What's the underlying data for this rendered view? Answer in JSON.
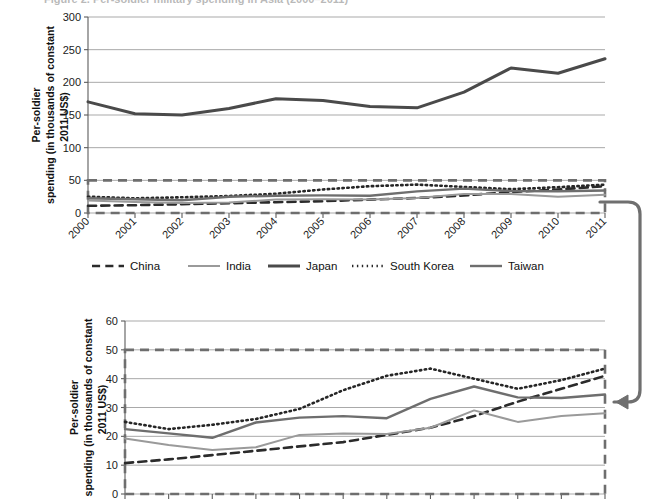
{
  "figure": {
    "title_fragment": "Figure 2. Per-soldier military spending in Asia (2000–2011)",
    "callout_name": "zoom-callout-arrow"
  },
  "axis": {
    "ylabel_line1": "Per-soldier",
    "ylabel_line2": "spending (in thousands of constant",
    "ylabel_line3": "2011 US$)",
    "ylabel_full": "Per-soldier spending (in thousands of constant 2011 US$)"
  },
  "legend": {
    "position": "below-top-chart",
    "items": [
      {
        "label": "China",
        "style": "dashed",
        "color": "#2b2b2b",
        "width": 2.6
      },
      {
        "label": "India",
        "style": "solid",
        "color": "#9a9a9a",
        "width": 2.0
      },
      {
        "label": "Japan",
        "style": "solid",
        "color": "#4a4a4a",
        "width": 3.0
      },
      {
        "label": "South Korea",
        "style": "dotted",
        "color": "#262626",
        "width": 2.6
      },
      {
        "label": "Taiwan",
        "style": "solid",
        "color": "#6e6e6e",
        "width": 2.4
      }
    ]
  },
  "chart_data": [
    {
      "id": "top-chart",
      "type": "line",
      "title": "",
      "xlabel": "",
      "ylabel": "Per-soldier spending (in thousands of constant 2011 US$)",
      "x": [
        "2000",
        "2001",
        "2002",
        "2003",
        "2004",
        "2005",
        "2006",
        "2007",
        "2008",
        "2009",
        "2010",
        "2011"
      ],
      "ylim": [
        0,
        300
      ],
      "yticks": [
        0,
        50,
        100,
        150,
        200,
        250,
        300
      ],
      "grid": true,
      "legend": "below",
      "highlight_box": {
        "y_from": 0,
        "y_to": 50,
        "style": "dashed",
        "color": "#6e6e6e"
      },
      "series": [
        {
          "name": "China",
          "values": [
            11,
            12,
            13.5,
            15,
            16.5,
            18,
            20.5,
            23,
            27,
            32,
            36,
            41
          ]
        },
        {
          "name": "India",
          "values": [
            19,
            17,
            15.3,
            16.2,
            20.5,
            21,
            20.8,
            23,
            29,
            29,
            25,
            28
          ]
        },
        {
          "name": "Japan",
          "values": [
            170,
            152,
            150,
            160,
            175,
            172,
            163,
            161,
            185,
            222,
            214,
            236
          ]
        },
        {
          "name": "South Korea",
          "values": [
            25,
            22.5,
            24,
            26,
            29.5,
            36,
            41,
            43.5,
            40,
            36.5,
            39.5,
            43.5
          ]
        },
        {
          "name": "Taiwan",
          "values": [
            22.5,
            21,
            19.5,
            24.8,
            26.5,
            27,
            26.3,
            33,
            37.3,
            33.5,
            33.3,
            34.5
          ]
        }
      ]
    },
    {
      "id": "bottom-chart",
      "type": "line",
      "title": "",
      "xlabel": "",
      "ylabel": "Per-soldier spending (in thousands of constant 2011 US$)",
      "x": [
        "2000",
        "2001",
        "2002",
        "2003",
        "2004",
        "2005",
        "2006",
        "2007",
        "2008",
        "2009",
        "2010",
        "2011"
      ],
      "ylim": [
        0,
        60
      ],
      "yticks": [
        0,
        10,
        20,
        30,
        40,
        50,
        60
      ],
      "grid": true,
      "legend": "none",
      "highlight_box": {
        "y_from": 0,
        "y_to": 50,
        "style": "dashed",
        "color": "#6e6e6e"
      },
      "note": "zoomed detail of the 0–50 band of the top chart",
      "series": [
        {
          "name": "China",
          "values": [
            10.7,
            12,
            13.5,
            15,
            16.5,
            18,
            20.5,
            23,
            27,
            32,
            36.5,
            41
          ]
        },
        {
          "name": "India",
          "values": [
            19.3,
            17,
            15.3,
            16.2,
            20.5,
            21,
            20.8,
            23,
            29,
            25,
            27,
            28
          ]
        },
        {
          "name": "South Korea",
          "values": [
            25,
            22.5,
            24,
            26,
            29.5,
            36,
            41,
            43.5,
            40,
            36.5,
            39.5,
            43.5
          ]
        },
        {
          "name": "Taiwan",
          "values": [
            22.5,
            21,
            19.5,
            24.8,
            26.5,
            27,
            26.3,
            33,
            37.3,
            33.5,
            33.3,
            34.5
          ]
        }
      ]
    }
  ]
}
